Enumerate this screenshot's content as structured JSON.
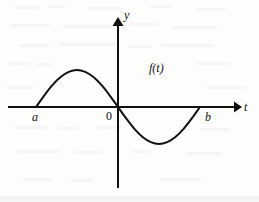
{
  "figure": {
    "kind": "math-function-graph",
    "background_color": "#fdfdfc",
    "ink_color": "#111111"
  },
  "labels": {
    "y_axis": "y",
    "t_axis": "t",
    "origin": "0",
    "left_root": "a",
    "right_root": "b",
    "function": "f(t)"
  },
  "chart_data": {
    "type": "line",
    "title": "",
    "subtitle": "",
    "xlabel": "t",
    "ylabel": "y",
    "grid": false,
    "legend": null,
    "annotations": [
      {
        "text": "f(t)",
        "x": 0.62,
        "y": 0.62,
        "note": "curve name placed above the descending branch"
      },
      {
        "text": "a",
        "x": -1.0,
        "y": 0.0,
        "note": "left zero crossing tick label, below axis"
      },
      {
        "text": "0",
        "x": 0.0,
        "y": 0.0,
        "note": "origin label, left of y-axis and below t-axis"
      },
      {
        "text": "b",
        "x": 1.0,
        "y": 0.0,
        "note": "right zero crossing tick label, below axis"
      }
    ],
    "axes": {
      "x_axis_arrow": true,
      "y_axis_arrow": true,
      "x_range": [
        -1.38,
        1.52
      ],
      "y_range": [
        -0.92,
        1.2
      ],
      "x_zero_crossings": [
        "a",
        "0",
        "b"
      ]
    },
    "series": [
      {
        "name": "f(t)",
        "description": "odd sine-like wave: positive hump from a to 0, negative trough from 0 to b",
        "x": [
          -1.0,
          -0.9,
          -0.8,
          -0.7,
          -0.6,
          -0.5,
          -0.4,
          -0.3,
          -0.2,
          -0.1,
          0.0,
          0.1,
          0.2,
          0.3,
          0.4,
          0.5,
          0.6,
          0.7,
          0.8,
          0.9,
          1.0
        ],
        "y": [
          0.0,
          0.31,
          0.59,
          0.81,
          0.95,
          1.0,
          0.95,
          0.81,
          0.59,
          0.31,
          0.0,
          -0.31,
          -0.59,
          -0.81,
          -0.95,
          -1.0,
          -0.95,
          -0.81,
          -0.59,
          -0.31,
          0.0
        ],
        "peak": {
          "x": -0.5,
          "y": 1.0
        },
        "trough": {
          "x": 0.5,
          "y": -1.0
        },
        "color": "#111111",
        "line_width": 2
      }
    ]
  }
}
